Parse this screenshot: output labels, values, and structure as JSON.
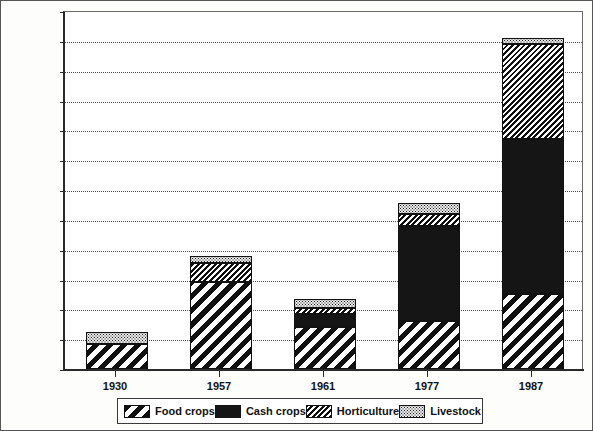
{
  "chart_data": {
    "type": "bar",
    "subtype": "stacked",
    "title": "",
    "xlabel": "",
    "ylabel": "Tons per km2",
    "ylabel_base": "Tons per km",
    "ylabel_sup": "2",
    "ylim": [
      0,
      120
    ],
    "ytick_step": 10,
    "yticks": [
      0,
      10,
      20,
      30,
      40,
      50,
      60,
      70,
      80,
      90,
      100,
      110,
      120
    ],
    "ytick_labels": [
      "0",
      "10",
      "20",
      "30",
      "40",
      "50",
      "60",
      "70",
      "80",
      "90",
      "100",
      "110",
      "120"
    ],
    "grid": true,
    "grid_style": "dotted",
    "legend_position": "bottom",
    "categories": [
      "1930",
      "1957",
      "1961",
      "1977",
      "1987"
    ],
    "series": [
      {
        "name": "Food crops",
        "pattern": "wide-diagonal-hatch",
        "values": [
          8.5,
          29,
          14,
          16,
          25
        ]
      },
      {
        "name": "Cash crops",
        "pattern": "solid-black",
        "values": [
          0,
          0,
          4.5,
          32,
          52
        ]
      },
      {
        "name": "Horticulture",
        "pattern": "fine-diagonal-hatch",
        "values": [
          0,
          6.5,
          2,
          4,
          32
        ]
      },
      {
        "name": "Livestock",
        "pattern": "stipple-dots",
        "values": [
          4,
          2.5,
          3,
          3.5,
          2
        ]
      }
    ],
    "totals": [
      12.5,
      38,
      23.5,
      55.5,
      111
    ],
    "bar_tops": [
      12.5,
      38,
      23.5,
      55.5,
      111
    ]
  },
  "legend": {
    "items": [
      {
        "label": "Food crops",
        "swatch": "wide-diagonal-hatch-swatch"
      },
      {
        "label": "Cash crops",
        "swatch": "solid-black-swatch"
      },
      {
        "label": "Horticulture",
        "swatch": "fine-diagonal-hatch-swatch"
      },
      {
        "label": "Livestock",
        "swatch": "stipple-dots-swatch"
      }
    ]
  }
}
